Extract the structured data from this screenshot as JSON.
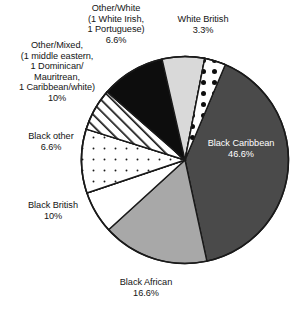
{
  "chart_data": {
    "type": "pie",
    "title": "",
    "subtitle": "",
    "xlabel": "",
    "ylabel": "",
    "legend_position": "none",
    "grid": false,
    "labels_outside": true,
    "categories": [
      "Black Caribbean",
      "Black African",
      "Black British",
      "Black other",
      "Other/Mixed, (1 middle eastern, 1 Dominican/Mauritrean, 1 Caribbean/white)",
      "Other/White (1 White Irish, 1 Portuguese)",
      "White British"
    ],
    "values": [
      46.6,
      16.6,
      10,
      6.6,
      10,
      6.6,
      3.3
    ],
    "slices": [
      {
        "name": "black-caribbean",
        "label_line1": "Black Caribbean",
        "label_line2": "46.6%",
        "value": 46.6,
        "start_deg": 0,
        "sweep_deg": 167.8,
        "fill": "#4a4a4a",
        "pattern": "solid",
        "text_color": "#ffffff"
      },
      {
        "name": "black-african",
        "label_line1": "Black African",
        "label_line2": "16.6%",
        "value": 16.6,
        "start_deg": 167.8,
        "sweep_deg": 59.8,
        "fill": "#a8a8a8",
        "pattern": "solid",
        "text_color": "#141414"
      },
      {
        "name": "unlabeled-white-wedge",
        "label_line1": "",
        "label_line2": "",
        "value": 6.6,
        "start_deg": 227.6,
        "sweep_deg": 23.8,
        "fill": "#ffffff",
        "pattern": "solid",
        "text_color": "#141414"
      },
      {
        "name": "black-british",
        "label_line1": "Black British",
        "label_line2": "10%",
        "value": 10,
        "start_deg": 251.4,
        "sweep_deg": 36,
        "fill": "#ffffff",
        "pattern": "sparse-dots",
        "text_color": "#141414"
      },
      {
        "name": "black-other",
        "label_line1": "Black other",
        "label_line2": "6.6%",
        "value": 6.6,
        "start_deg": 287.4,
        "sweep_deg": 23.8,
        "fill": "#ffffff",
        "pattern": "diagonal-hatch",
        "text_color": "#141414"
      },
      {
        "name": "other-mixed",
        "label_line1": "Other/Mixed,",
        "label_line2": "(1 middle eastern,",
        "label_line3": "1 Dominican/",
        "label_line4": "Mauritrean,",
        "label_line5": "1 Caribbean/white)",
        "label_line6": "10%",
        "value": 10,
        "start_deg": 311.2,
        "sweep_deg": 36,
        "fill": "#0d0d0d",
        "pattern": "solid",
        "text_color": "#141414"
      },
      {
        "name": "other-white",
        "label_line1": "Other/White",
        "label_line2": "(1 White Irish,",
        "label_line3": "1 Portuguese)",
        "label_line4": "6.6%",
        "value": 6.6,
        "start_deg": 347.2,
        "sweep_deg": 23.8,
        "fill": "#d9d9d9",
        "pattern": "solid",
        "text_color": "#141414"
      },
      {
        "name": "white-british",
        "label_line1": "White British",
        "label_line2": "3.3%",
        "value": 3.3,
        "start_deg": 371,
        "sweep_deg": 11.9,
        "fill": "#ffffff",
        "pattern": "polka-dots",
        "text_color": "#141414"
      }
    ]
  },
  "labels": {
    "other_white": "Other/White\n(1 White Irish,\n1 Portuguese)\n6.6%",
    "white_british": "White British\n3.3%",
    "other_mixed": "Other/Mixed,\n(1 middle eastern,\n1 Dominican/\nMauritrean,\n1 Caribbean/white)\n10%",
    "black_other": "Black other\n6.6%",
    "black_british": "Black British\n10%",
    "black_african": "Black African\n16.6%",
    "black_caribbean": "Black Caribbean\n46.6%"
  },
  "colors": {
    "dark_gray": "#4a4a4a",
    "medium_gray": "#a8a8a8",
    "light_gray": "#d9d9d9",
    "black": "#0d0d0d",
    "white": "#ffffff",
    "outline": "#1a1a1a"
  }
}
